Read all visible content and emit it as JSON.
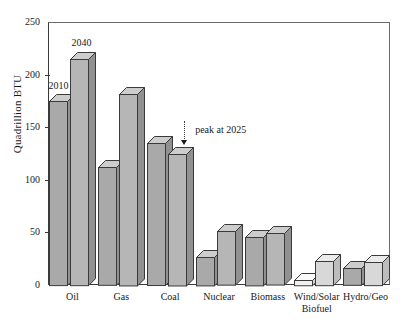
{
  "chart_data": {
    "type": "bar",
    "title": "",
    "subtitle": "",
    "xlabel": "",
    "ylabel": "Quadrillion BTU",
    "ylim": [
      0,
      250
    ],
    "yticks": [
      0,
      50,
      100,
      150,
      200,
      250
    ],
    "ytick_labels": [
      "0",
      "50",
      "100",
      "150",
      "200",
      "250"
    ],
    "grid": false,
    "legend_position": "inline-data-labels",
    "categories": [
      "Oil",
      "Gas",
      "Coal",
      "Nuclear",
      "Biomass",
      "Wind/Solar Biofuel",
      "Hydro/Geo"
    ],
    "category_lines": [
      [
        "Oil",
        ""
      ],
      [
        "Gas",
        ""
      ],
      [
        "Coal",
        ""
      ],
      [
        "Nuclear",
        ""
      ],
      [
        "Biomass",
        ""
      ],
      [
        "Wind/Solar",
        "Biofuel"
      ],
      [
        "Hydro/Geo",
        ""
      ]
    ],
    "series": [
      {
        "name": "2010",
        "color": "#a8a8a8",
        "values": [
          175,
          112,
          135,
          27,
          46,
          5,
          16
        ]
      },
      {
        "name": "2040",
        "color": "#b5b5b5",
        "values": [
          215,
          182,
          125,
          51,
          49,
          23,
          22
        ]
      }
    ],
    "annotations": [
      {
        "text": "peak at 2025",
        "target_category": "Coal",
        "target_series": "2040",
        "style": "dotted-leader-with-arrow"
      }
    ],
    "series_labels_inline": [
      {
        "text": "2010",
        "series": "2010",
        "at_category": "Oil"
      },
      {
        "text": "2040",
        "series": "2040",
        "at_category": "Oil"
      }
    ]
  },
  "style": {
    "bar_face": "#b0b0b0",
    "bar_face_light": "#d6d6d6",
    "bar_top": "#cfcfcf",
    "bar_side": "#8f8f8f",
    "outline": "#3a3a3a",
    "background": "#ffffff",
    "text": "#1a1a1a"
  }
}
